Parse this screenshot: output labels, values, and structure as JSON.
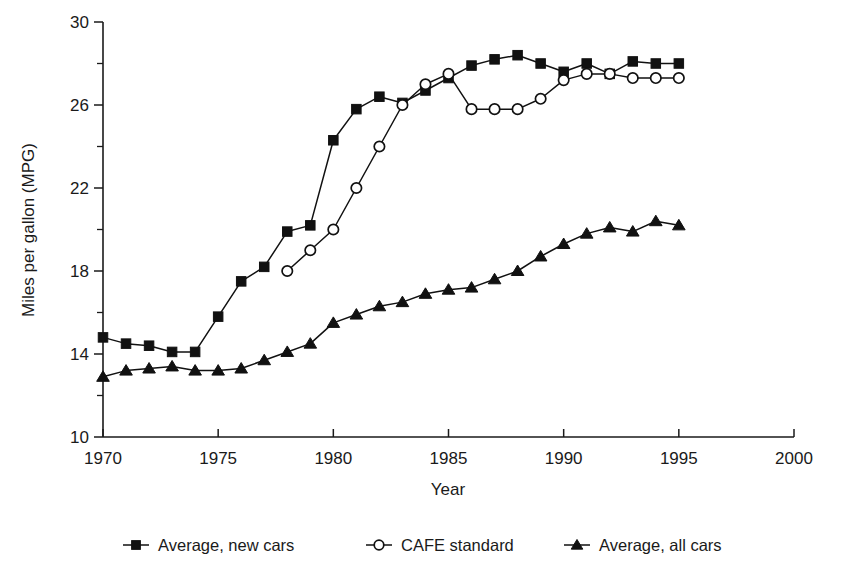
{
  "chart_data": {
    "type": "line",
    "title": "",
    "xlabel": "Year",
    "ylabel": "Miles per gallon (MPG)",
    "xlim": [
      1970,
      2000
    ],
    "ylim": [
      10,
      30
    ],
    "xticks": [
      1970,
      1975,
      1980,
      1985,
      1990,
      1995,
      2000
    ],
    "xtick_labels": [
      "1970",
      "1975",
      "1980",
      "1985",
      "1990",
      "1995",
      "2000"
    ],
    "yticks": [
      10,
      14,
      18,
      22,
      26,
      30
    ],
    "ytick_labels": [
      "10",
      "14",
      "18",
      "22",
      "26",
      "30"
    ],
    "yticks_minor": [
      12,
      16,
      20,
      24,
      28
    ],
    "grid": false,
    "legend_position": "below",
    "series": [
      {
        "name": "Average, new cars",
        "marker": "filled-square",
        "x": [
          1970,
          1971,
          1972,
          1973,
          1974,
          1975,
          1976,
          1977,
          1978,
          1979,
          1980,
          1981,
          1982,
          1983,
          1984,
          1985,
          1986,
          1987,
          1988,
          1989,
          1990,
          1991,
          1992,
          1993,
          1994,
          1995
        ],
        "values": [
          14.8,
          14.5,
          14.4,
          14.1,
          14.1,
          15.8,
          17.5,
          18.2,
          19.9,
          20.2,
          24.3,
          25.8,
          26.4,
          26.1,
          26.7,
          27.3,
          27.9,
          28.2,
          28.4,
          28.0,
          27.6,
          28.0,
          27.5,
          28.1,
          28.0,
          28.0
        ]
      },
      {
        "name": "CAFE standard",
        "marker": "open-circle",
        "x": [
          1978,
          1979,
          1980,
          1981,
          1982,
          1983,
          1984,
          1985,
          1986,
          1987,
          1988,
          1989,
          1990,
          1991,
          1992,
          1993,
          1994,
          1995
        ],
        "values": [
          18.0,
          19.0,
          20.0,
          22.0,
          24.0,
          26.0,
          27.0,
          27.5,
          25.8,
          25.8,
          25.8,
          26.3,
          27.2,
          27.5,
          27.5,
          27.3,
          27.3,
          27.3
        ]
      },
      {
        "name": "Average, all cars",
        "marker": "filled-triangle",
        "x": [
          1970,
          1971,
          1972,
          1973,
          1974,
          1975,
          1976,
          1977,
          1978,
          1979,
          1980,
          1981,
          1982,
          1983,
          1984,
          1985,
          1986,
          1987,
          1988,
          1989,
          1990,
          1991,
          1992,
          1993,
          1994,
          1995
        ],
        "values": [
          12.9,
          13.2,
          13.3,
          13.4,
          13.2,
          13.2,
          13.3,
          13.7,
          14.1,
          14.5,
          15.5,
          15.9,
          16.3,
          16.5,
          16.9,
          17.1,
          17.2,
          17.6,
          18.0,
          18.7,
          19.3,
          19.8,
          20.1,
          19.9,
          20.4,
          20.2
        ]
      }
    ]
  },
  "legend": {
    "items": [
      {
        "label": "Average, new cars",
        "marker": "filled-square"
      },
      {
        "label": "CAFE standard",
        "marker": "open-circle"
      },
      {
        "label": "Average, all cars",
        "marker": "filled-triangle"
      }
    ]
  },
  "colors": {
    "ink": "#111111",
    "background": "#ffffff"
  }
}
